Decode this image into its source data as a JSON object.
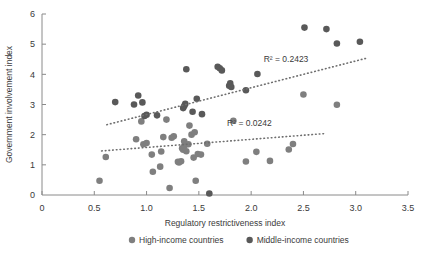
{
  "chart_data": {
    "type": "scatter",
    "title": "",
    "xlabel": "Regulatory restrictiveness index",
    "ylabel": "Government involvement index",
    "xlim": [
      0,
      3.5
    ],
    "ylim": [
      0,
      6
    ],
    "xticks": [
      "0",
      "0.5",
      "1.0",
      "1.5",
      "2.0",
      "2.5",
      "3.0",
      "3.5"
    ],
    "xtick_values": [
      0,
      0.5,
      1.0,
      1.5,
      2.0,
      2.5,
      3.0,
      3.5
    ],
    "yticks": [
      "0",
      "1",
      "2",
      "3",
      "4",
      "5",
      "6"
    ],
    "ytick_values": [
      0,
      1,
      2,
      3,
      4,
      5,
      6
    ],
    "grid": false,
    "legend_position": "bottom",
    "colors": {
      "high_income": "#7f7f7f",
      "middle_income": "#595959",
      "axis": "#8a8a8a",
      "text": "#3a3a3a"
    },
    "series": [
      {
        "name": "High-income countries",
        "color": "#7f7f7f",
        "marker": "circle",
        "points": [
          [
            0.55,
            0.47
          ],
          [
            0.61,
            1.26
          ],
          [
            0.9,
            1.85
          ],
          [
            0.95,
            2.44
          ],
          [
            0.97,
            1.68
          ],
          [
            1.0,
            1.72
          ],
          [
            1.05,
            1.34
          ],
          [
            1.06,
            0.77
          ],
          [
            1.13,
            0.94
          ],
          [
            1.14,
            1.44
          ],
          [
            1.16,
            1.92
          ],
          [
            1.19,
            2.5
          ],
          [
            1.22,
            0.23
          ],
          [
            1.24,
            1.9
          ],
          [
            1.26,
            1.95
          ],
          [
            1.3,
            1.1
          ],
          [
            1.31,
            1.08
          ],
          [
            1.33,
            1.12
          ],
          [
            1.34,
            1.55
          ],
          [
            1.35,
            1.5
          ],
          [
            1.36,
            1.62
          ],
          [
            1.36,
            1.78
          ],
          [
            1.38,
            1.45
          ],
          [
            1.4,
            1.68
          ],
          [
            1.41,
            2.3
          ],
          [
            1.43,
            2.0
          ],
          [
            1.45,
            1.24
          ],
          [
            1.46,
            2.08
          ],
          [
            1.47,
            0.47
          ],
          [
            1.49,
            1.36
          ],
          [
            1.52,
            1.34
          ],
          [
            1.58,
            1.7
          ],
          [
            1.83,
            2.46
          ],
          [
            1.95,
            1.11
          ],
          [
            2.05,
            1.43
          ],
          [
            2.18,
            1.13
          ],
          [
            2.36,
            1.51
          ],
          [
            2.4,
            1.69
          ],
          [
            2.5,
            3.33
          ],
          [
            2.82,
            2.99
          ]
        ]
      },
      {
        "name": "Middle-income countries",
        "color": "#595959",
        "marker": "circle",
        "points": [
          [
            0.7,
            3.08
          ],
          [
            0.88,
            3.0
          ],
          [
            0.92,
            3.3
          ],
          [
            0.96,
            3.07
          ],
          [
            0.98,
            2.62
          ],
          [
            1.0,
            2.66
          ],
          [
            1.1,
            2.64
          ],
          [
            1.35,
            2.88
          ],
          [
            1.36,
            2.95
          ],
          [
            1.37,
            3.02
          ],
          [
            1.38,
            4.17
          ],
          [
            1.44,
            2.76
          ],
          [
            1.48,
            3.19
          ],
          [
            1.53,
            2.68
          ],
          [
            1.6,
            0.05
          ],
          [
            1.68,
            4.25
          ],
          [
            1.7,
            4.2
          ],
          [
            1.72,
            4.13
          ],
          [
            1.79,
            3.62
          ],
          [
            1.8,
            3.7
          ],
          [
            1.81,
            3.58
          ],
          [
            1.95,
            3.47
          ],
          [
            2.06,
            4.01
          ],
          [
            2.51,
            5.55
          ],
          [
            2.72,
            5.5
          ],
          [
            2.82,
            5.02
          ],
          [
            3.04,
            5.08
          ]
        ]
      }
    ],
    "trendlines": [
      {
        "name": "Middle-income trendline",
        "style": "dotted",
        "color": "#6e6e6e",
        "x_start": 0.62,
        "y_start": 2.33,
        "x_end": 3.12,
        "y_end": 4.55,
        "r2_label": "R² = 0.2423",
        "r2_value": 0.2423
      },
      {
        "name": "High-income trendline",
        "style": "dotted",
        "color": "#6e6e6e",
        "x_start": 0.57,
        "y_start": 1.46,
        "x_end": 2.72,
        "y_end": 2.04,
        "r2_label": "R² = 0.0242",
        "r2_value": 0.0242
      }
    ],
    "legend": [
      {
        "label": "High-income countries",
        "color": "#7f7f7f"
      },
      {
        "label": "Middle-income countries",
        "color": "#595959"
      }
    ]
  }
}
